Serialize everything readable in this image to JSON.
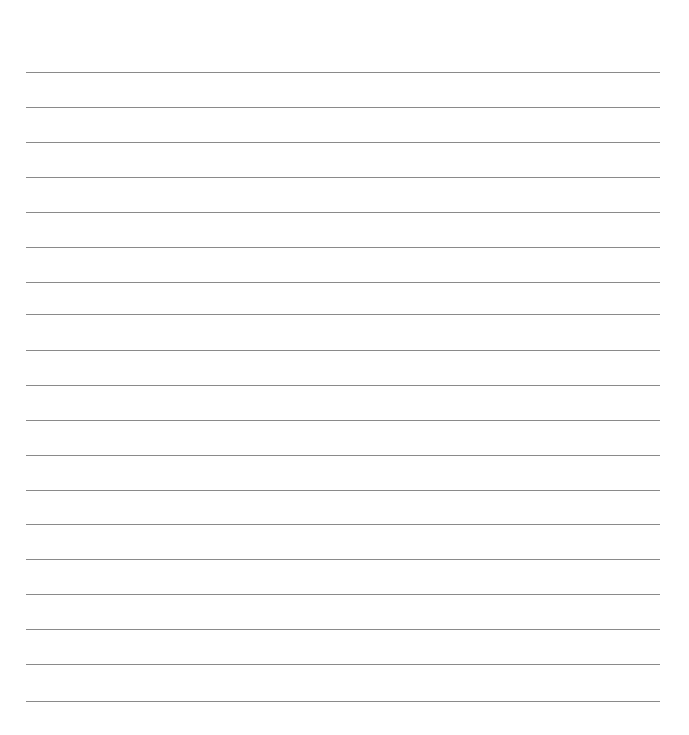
{
  "page": {
    "type": "lined-paper",
    "background_color": "#ffffff",
    "rule_color": "#8a8a8a",
    "rule_count": 19,
    "rule_left": 26,
    "rule_right": 660,
    "rule_positions_y": [
      72,
      107,
      142,
      177,
      212,
      247,
      282,
      314,
      350,
      385,
      420,
      455,
      490,
      524,
      559,
      594,
      629,
      664,
      701
    ]
  }
}
